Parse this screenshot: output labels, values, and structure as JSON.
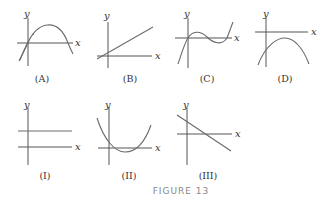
{
  "figure": {
    "caption": "FIGURE 13",
    "axis_labels": {
      "x": "x",
      "y": "y"
    },
    "top_row": [
      {
        "label": "(A)",
        "description": "downward parabola through origin, crossing x-axis at origin and at positive x"
      },
      {
        "label": "(B)",
        "description": "increasing straight line with small positive slope through near origin"
      },
      {
        "label": "(C)",
        "description": "cubic through origin with local max then local min, rising at both ends"
      },
      {
        "label": "(D)",
        "description": "downward parabola entirely below x-axis with vertex to the right of y-axis"
      }
    ],
    "bottom_row": [
      {
        "label": "(I)",
        "description": "horizontal line above x-axis"
      },
      {
        "label": "(II)",
        "description": "upward parabola with vertex slightly below x-axis to the right of y-axis"
      },
      {
        "label": "(III)",
        "description": "decreasing straight line with positive y-intercept"
      }
    ]
  },
  "colors": {
    "axes": "#555555",
    "curves": "#6a6a6a",
    "text": "#333333",
    "caption": "#888888"
  }
}
